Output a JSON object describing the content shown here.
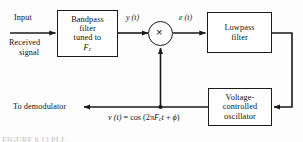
{
  "diagram": {
    "stroke_color": "#1a1a1a",
    "background": "#fdfdfd",
    "blocks": {
      "bandpass": {
        "line1": "Bandpass",
        "line2": "filter",
        "line3": "tuned to",
        "line4_base": "F",
        "line4_sub": "c"
      },
      "lowpass": {
        "line1": "Lowpass",
        "line2": "filter"
      },
      "vco": {
        "line1": "Voltage-",
        "line2": "controlled",
        "line3": "oscillator"
      },
      "multiplier": {
        "glyph": "×",
        "name": "multiplier"
      }
    },
    "labels": {
      "input": "Input",
      "received_signal_line1": "Received",
      "received_signal_line2": "signal",
      "to_demodulator": "To demodulator"
    },
    "signals": {
      "y_of_t": "y (t)",
      "e_of_t": "e (t)"
    },
    "equation": {
      "lhs": "v (t)",
      "equals": " = ",
      "fn": "cos",
      "open": " (2π",
      "base": "F",
      "sub": "c",
      "var": "t",
      "plus": " + ",
      "phase": "ϕ",
      "close": ")"
    },
    "caption": "FIGURE 6.13   PLL"
  }
}
